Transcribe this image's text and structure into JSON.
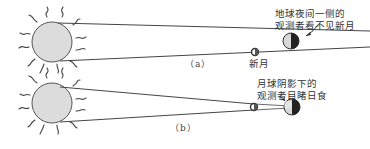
{
  "diagram": {
    "panels": [
      {
        "id": "a",
        "label": "（a）",
        "sun": {
          "cx": 52,
          "cy": 42,
          "r": 20
        },
        "moon": {
          "cx": 255,
          "cy": 52,
          "r": 3.5,
          "label": "新月"
        },
        "earth": {
          "cx": 291,
          "cy": 41,
          "r": 8
        },
        "annotation": {
          "line1": "地球夜间一侧的",
          "line2": "观测者看不见新月"
        }
      },
      {
        "id": "b",
        "label": "（b）",
        "sun": {
          "cx": 52,
          "cy": 103,
          "r": 20
        },
        "moon": {
          "cx": 254,
          "cy": 107,
          "r": 3.5
        },
        "earth": {
          "cx": 292,
          "cy": 107,
          "r": 8
        },
        "annotation": {
          "line1": "月球阴影下的",
          "line2": "观测者目睹日食"
        }
      }
    ],
    "colors": {
      "sun_fill": "#dcdcdc",
      "outline": "#444444",
      "earth_light": "#d8d8d8",
      "earth_dark": "#222222",
      "text": "#333333"
    }
  }
}
